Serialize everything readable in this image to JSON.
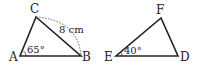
{
  "figure": {
    "triangle_abc": {
      "vertices": {
        "A": {
          "label": "A"
        },
        "B": {
          "label": "B"
        },
        "C": {
          "label": "C"
        }
      },
      "angle_A": "65°",
      "side_CB": "8 cm"
    },
    "triangle_def": {
      "vertices": {
        "D": {
          "label": "D"
        },
        "E": {
          "label": "E"
        },
        "F": {
          "label": "F"
        }
      },
      "angle_E": "40°"
    },
    "colors": {
      "line": "#222222",
      "background": "#ffffff"
    }
  }
}
